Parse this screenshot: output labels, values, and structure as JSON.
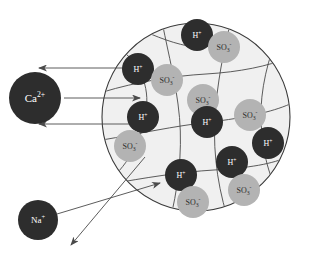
{
  "diagram": {
    "background_color": "#ffffff",
    "bead": {
      "name": "resin-bead",
      "fill": "#f0f0f0",
      "stroke": "#3a3a3a",
      "cx": 196,
      "cy": 117,
      "r": 94
    },
    "colors": {
      "dark_ion": "#2d2d2d",
      "dark_ion_text": "#ffffff",
      "light_ion": "#b3b3b3",
      "light_ion_text": "#2d2d2d",
      "arrow": "#4a4a4a",
      "mesh_line": "#4a4a4a"
    }
  },
  "external_ions": [
    {
      "id": "ca",
      "label": "Ca",
      "sup": "2+",
      "cx": 35,
      "cy": 98,
      "r": 26,
      "style": "dark"
    },
    {
      "id": "na",
      "label": "Na",
      "sup": "+",
      "cx": 38,
      "cy": 220,
      "r": 20,
      "style": "dark"
    }
  ],
  "internal_ions": [
    {
      "id": "h1",
      "label": "H",
      "sup": "+",
      "cx": 197,
      "cy": 35,
      "r": 16,
      "style": "dark"
    },
    {
      "id": "so3a",
      "label": "SO",
      "sub": "3",
      "sup": "-",
      "cx": 224,
      "cy": 47,
      "r": 16,
      "style": "light"
    },
    {
      "id": "h2",
      "label": "H",
      "sup": "+",
      "cx": 138,
      "cy": 69,
      "r": 16,
      "style": "dark"
    },
    {
      "id": "so3b",
      "label": "SO",
      "sub": "3",
      "sup": "-",
      "cx": 167,
      "cy": 80,
      "r": 16,
      "style": "light"
    },
    {
      "id": "so3c",
      "label": "SO",
      "sub": "3",
      "sup": "-",
      "cx": 203,
      "cy": 100,
      "r": 16,
      "style": "light"
    },
    {
      "id": "so3d",
      "label": "SO",
      "sub": "3",
      "sup": "-",
      "cx": 250,
      "cy": 115,
      "r": 16,
      "style": "light"
    },
    {
      "id": "h3",
      "label": "H",
      "sup": "+",
      "cx": 143,
      "cy": 117,
      "r": 16,
      "style": "dark"
    },
    {
      "id": "h4",
      "label": "H",
      "sup": "+",
      "cx": 207,
      "cy": 122,
      "r": 16,
      "style": "dark"
    },
    {
      "id": "h5",
      "label": "H",
      "sup": "+",
      "cx": 268,
      "cy": 143,
      "r": 16,
      "style": "dark"
    },
    {
      "id": "so3e",
      "label": "SO",
      "sub": "3",
      "sup": "-",
      "cx": 130,
      "cy": 146,
      "r": 16,
      "style": "light"
    },
    {
      "id": "h6",
      "label": "H",
      "sup": "+",
      "cx": 232,
      "cy": 162,
      "r": 16,
      "style": "dark"
    },
    {
      "id": "h7",
      "label": "H",
      "sup": "+",
      "cx": 181,
      "cy": 175,
      "r": 16,
      "style": "dark"
    },
    {
      "id": "so3f",
      "label": "SO",
      "sub": "3",
      "sup": "-",
      "cx": 244,
      "cy": 190,
      "r": 16,
      "style": "light"
    },
    {
      "id": "so3g",
      "label": "SO",
      "sub": "3",
      "sup": "-",
      "cx": 193,
      "cy": 202,
      "r": 16,
      "style": "light"
    }
  ],
  "arrows": [
    {
      "id": "arrow-out-top",
      "x1": 140,
      "y1": 68,
      "x2": 39,
      "y2": 68,
      "direction": "out"
    },
    {
      "id": "arrow-in-ca",
      "x1": 64,
      "y1": 98,
      "x2": 140,
      "y2": 98,
      "direction": "in"
    },
    {
      "id": "arrow-out-mid",
      "x1": 140,
      "y1": 124,
      "x2": 39,
      "y2": 124,
      "direction": "out"
    },
    {
      "id": "arrow-in-na",
      "x1": 57,
      "y1": 214,
      "x2": 160,
      "y2": 183,
      "direction": "in"
    },
    {
      "id": "arrow-out-bottom",
      "x1": 145,
      "y1": 157,
      "x2": 71,
      "y2": 245,
      "direction": "out"
    }
  ],
  "mesh_paths": [
    "M 118 48 C 140 62 150 86 146 112 C 142 140 128 164 110 180",
    "M 160 11 C 166 44 174 74 178 104 C 183 140 180 176 172 212",
    "M 234 8 C 226 40 219 72 216 104 C 212 142 216 180 227 216",
    "M 280 30 C 268 58 260 90 261 120 C 262 152 270 182 282 198",
    "M 103 92 C 136 82 172 76 206 74 C 240 72 268 66 288 58",
    "M 102 140 C 138 134 174 126 210 122 C 244 118 272 112 290 104",
    "M 110 184 C 144 178 180 172 214 170 C 248 168 274 164 289 156",
    "M 128 24 C 150 34 168 42 188 46",
    "M 140 210 C 170 216 206 220 240 218"
  ]
}
